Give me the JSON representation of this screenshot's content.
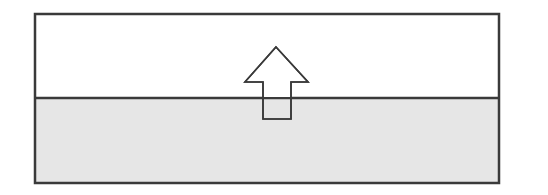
{
  "diagram": {
    "colors": {
      "border": "#3a3a3a",
      "upper_fill": "#ffffff",
      "lower_fill": "#e6e6e6",
      "arrow_fill": "#ffffff",
      "arrow_stroke": "#3a3a3a"
    },
    "regions": [
      {
        "name": "upper-region",
        "fill": "white"
      },
      {
        "name": "lower-region",
        "fill": "light gray"
      }
    ],
    "arrow": {
      "direction": "up",
      "style": "outlined",
      "icon": "arrow-up-icon"
    }
  }
}
